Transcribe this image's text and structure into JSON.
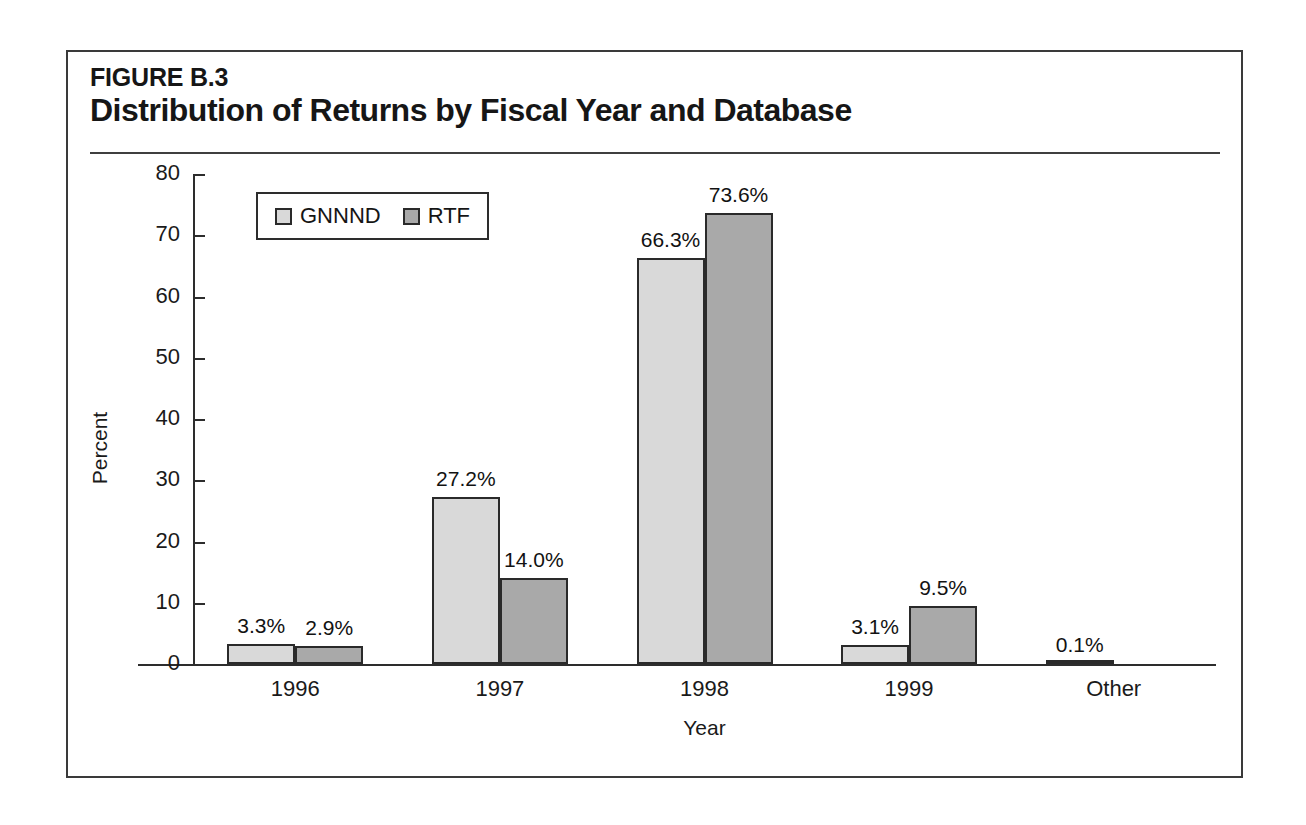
{
  "figure": {
    "number": "FIGURE B.3",
    "title": "Distribution of Returns by Fiscal Year and Database"
  },
  "legend": {
    "position": "top-left",
    "entries": [
      {
        "label": "GNNND",
        "color": "#d9d9d9"
      },
      {
        "label": "RTF",
        "color": "#a9a9a9"
      }
    ]
  },
  "axes": {
    "y_title": "Percent",
    "x_title": "Year",
    "y_ticks": [
      "0",
      "10",
      "20",
      "30",
      "40",
      "50",
      "60",
      "70",
      "80"
    ],
    "x_ticks": [
      "1996",
      "1997",
      "1998",
      "1999",
      "Other"
    ]
  },
  "chart_data": {
    "type": "bar",
    "title": "Distribution of Returns by Fiscal Year and Database",
    "xlabel": "Year",
    "ylabel": "Percent",
    "ylim": [
      0,
      80
    ],
    "ytick_step": 10,
    "grid": false,
    "legend_position": "upper left",
    "categories": [
      "1996",
      "1997",
      "1998",
      "1999",
      "Other"
    ],
    "series": [
      {
        "name": "GNNND",
        "color": "#d9d9d9",
        "values": [
          3.3,
          27.2,
          66.3,
          3.1,
          0.1
        ],
        "labels": [
          "3.3%",
          "27.2%",
          "66.3%",
          "3.1%",
          "0.1%"
        ]
      },
      {
        "name": "RTF",
        "color": "#a9a9a9",
        "values": [
          2.9,
          14.0,
          73.6,
          9.5,
          0.0
        ],
        "labels": [
          "2.9%",
          "14.0%",
          "73.6%",
          "9.5%",
          ""
        ]
      }
    ]
  }
}
